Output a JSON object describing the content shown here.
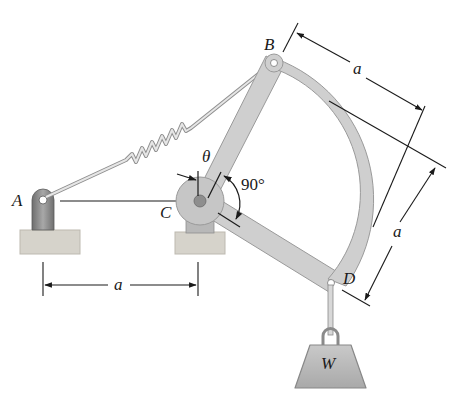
{
  "figure": {
    "type": "mechanism-diagram",
    "points": {
      "A": {
        "label": "A"
      },
      "B": {
        "label": "B"
      },
      "C": {
        "label": "C"
      },
      "D": {
        "label": "D"
      }
    },
    "angle": {
      "theta": "θ",
      "right_angle": "90°"
    },
    "dimensions": {
      "AC": "a",
      "CB": "a",
      "CD": "a"
    },
    "weight": {
      "label": "W"
    },
    "colors": {
      "member_fill": "#cfcfcf",
      "member_stroke": "#9a9a9a",
      "support_fill": "#d6d3cb",
      "bracket_fill": "#8a8a8a",
      "line": "#1a1a1a",
      "spring": "#bdbdbd"
    }
  }
}
